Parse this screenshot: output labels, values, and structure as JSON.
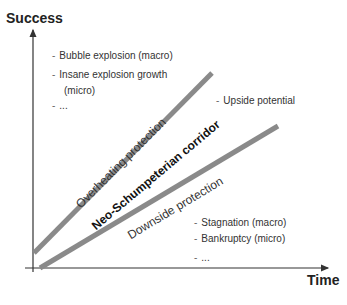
{
  "axes": {
    "y_label": "Success",
    "x_label": "Time"
  },
  "bands": {
    "upper_label": "Overheating protection",
    "middle_label": "Neo-Schumpeterian corridor",
    "lower_label": "Downside protection"
  },
  "notes": {
    "top": [
      "Bubble explosion (macro)",
      "Insane explosion growth",
      "(micro)",
      "..."
    ],
    "right": [
      "Upside potential"
    ],
    "bottom": [
      "Stagnation (macro)",
      "Bankruptcy (micro)",
      "..."
    ]
  },
  "colors": {
    "axis": "#333333",
    "band_line": "#8a8a8a",
    "text": "#333333"
  }
}
